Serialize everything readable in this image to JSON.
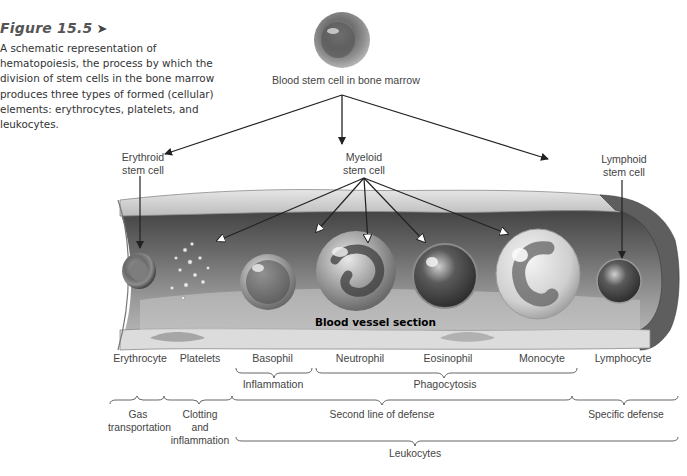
{
  "figure": {
    "number_label": "Figure 15.5",
    "arrow_glyph": "➤",
    "caption": "A schematic representation of hematopoiesis, the process by which the division of stem cells in the bone marrow produces three types of formed (cellular) elements: erythrocytes, platelets, and leukocytes."
  },
  "diagram": {
    "root": {
      "label": "Blood stem cell in bone marrow",
      "icon": "stem-cell-illustration"
    },
    "stem_cells": [
      {
        "line1": "Erythroid",
        "line2": "stem cell"
      },
      {
        "line1": "Myeloid",
        "line2": "stem cell"
      },
      {
        "line1": "Lymphoid",
        "line2": "stem cell"
      }
    ],
    "vessel_label": "Blood vessel section",
    "cells": [
      {
        "label": "Erythrocyte"
      },
      {
        "label": "Platelets"
      },
      {
        "label": "Basophil"
      },
      {
        "label": "Neutrophil"
      },
      {
        "label": "Eosinophil"
      },
      {
        "label": "Monocyte"
      },
      {
        "label": "Lymphocyte"
      }
    ],
    "functions_row1": [
      {
        "label": "Inflammation"
      },
      {
        "label": "Phagocytosis"
      }
    ],
    "functions_row2": [
      {
        "line1": "Gas",
        "line2": "transportation"
      },
      {
        "line1": "Clotting",
        "line2": "and",
        "line3": "inflammation"
      },
      {
        "label": "Second line of defense"
      },
      {
        "label": "Specific defense"
      }
    ],
    "group": {
      "label": "Leukocytes"
    }
  },
  "colors": {
    "text": "#3a3a3a",
    "line": "#222222",
    "vessel_dark": "#4a4a4a",
    "vessel_light": "#d8d8d8"
  }
}
